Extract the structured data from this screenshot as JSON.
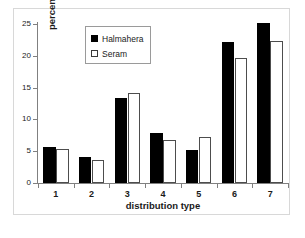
{
  "chart_data": {
    "type": "bar",
    "title": "",
    "xlabel": "distribution type",
    "ylabel": "percentages",
    "categories": [
      "1",
      "2",
      "3",
      "4",
      "5",
      "6",
      "7"
    ],
    "series": [
      {
        "name": "Halmahera",
        "color": "#000000",
        "fill": "solid",
        "values": [
          5.6,
          4.1,
          13.3,
          7.8,
          5.2,
          22.2,
          25.2
        ]
      },
      {
        "name": "Seram",
        "color": "#ffffff",
        "fill": "open",
        "values": [
          5.4,
          3.6,
          14.2,
          6.8,
          7.3,
          19.7,
          22.3
        ]
      }
    ],
    "ylim": [
      0,
      25
    ],
    "yticks": [
      0,
      5,
      10,
      15,
      20,
      25
    ],
    "ytick_labels": [
      "0",
      "5",
      "10",
      "15",
      "20",
      "25"
    ],
    "grid": false,
    "legend_position": "top-left-inside"
  },
  "legend": {
    "entries": [
      {
        "label": "Halmahera",
        "swatch": "filled-black-square"
      },
      {
        "label": "Seram",
        "swatch": "open-white-square"
      }
    ]
  },
  "axes": {
    "x_label": "distribution type",
    "y_label": "percentages"
  }
}
